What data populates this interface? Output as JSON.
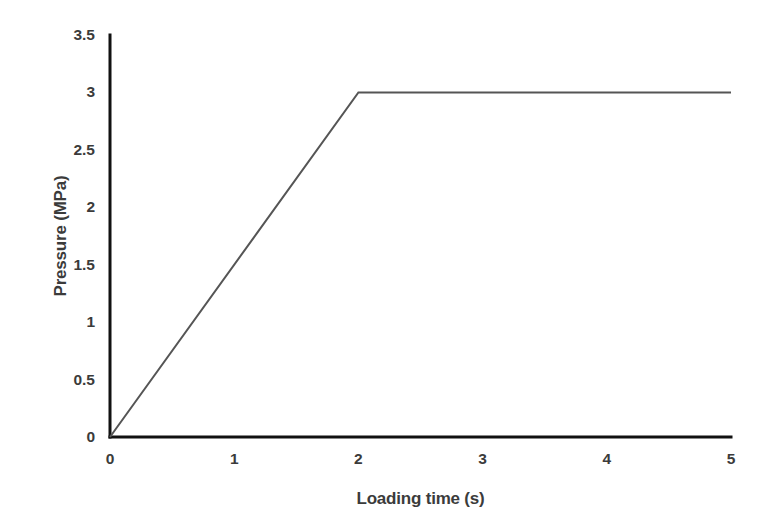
{
  "chart_data": {
    "type": "line",
    "title": "",
    "xlabel": "Loading time (s)",
    "ylabel": "Pressure (MPa)",
    "xlim": [
      0,
      5
    ],
    "ylim": [
      0,
      3.5
    ],
    "xticks": [
      0,
      1,
      2,
      3,
      4,
      5
    ],
    "xtick_labels": [
      "0",
      "1",
      "2",
      "3",
      "4",
      "5"
    ],
    "yticks": [
      0,
      0.5,
      1,
      1.5,
      2,
      2.5,
      3,
      3.5
    ],
    "ytick_labels": [
      "0",
      "0.5",
      "1",
      "1.5",
      "2",
      "2.5",
      "3",
      "3.5"
    ],
    "grid": false,
    "legend": false,
    "legend_position": "none",
    "series": [
      {
        "name": "Pressure",
        "x": [
          0,
          2,
          5
        ],
        "values": [
          0,
          3,
          3
        ],
        "color": "#555555",
        "line_width": 2,
        "markers": false
      }
    ],
    "annotations": [],
    "axis_color": "#111111",
    "axis_line_width": 3,
    "tick_label_color": "#3b3b3b",
    "background_color": "#ffffff"
  },
  "plot_geometry": {
    "left_px": 110,
    "right_px": 731,
    "top_px": 35,
    "bottom_px": 437
  }
}
